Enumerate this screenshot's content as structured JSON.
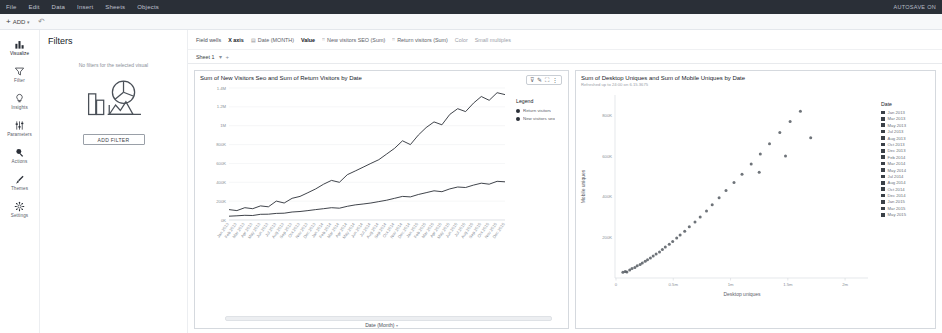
{
  "menubar": {
    "items": [
      "File",
      "Edit",
      "Data",
      "Insert",
      "Sheets",
      "Objects"
    ],
    "autosave": "AUTOSAVE ON"
  },
  "actionbar": {
    "add_label": "ADD",
    "add_icon": "plus-icon",
    "chevron_icon": "chevron-down-icon",
    "undo_icon": "undo-icon"
  },
  "rail": {
    "items": [
      {
        "label": "Visualize",
        "icon": "bar-chart-icon"
      },
      {
        "label": "Filter",
        "icon": "funnel-icon"
      },
      {
        "label": "Insights",
        "icon": "lightbulb-icon"
      },
      {
        "label": "Parameters",
        "icon": "sliders-icon"
      },
      {
        "label": "Actions",
        "icon": "cursor-click-icon"
      },
      {
        "label": "Themes",
        "icon": "paintbrush-icon"
      },
      {
        "label": "Settings",
        "icon": "gear-icon"
      }
    ]
  },
  "filters": {
    "title": "Filters",
    "empty_message": "No filters for the selected visual",
    "add_button": "ADD FILTER",
    "illustration_icon": "charts-illustration-icon"
  },
  "fieldwells": {
    "title": "Field wells",
    "xaxis_label": "X axis",
    "xaxis_field": "Date (MONTH)",
    "xaxis_icon": "calendar-icon",
    "value_label": "Value",
    "value_fields": [
      {
        "name": "New visitors SEO (Sum)",
        "icon": "measure-icon"
      },
      {
        "name": "Return visitors (Sum)",
        "icon": "measure-icon"
      }
    ],
    "color_label": "Color",
    "small_multiples_label": "Small multiples"
  },
  "sheetbar": {
    "name": "Sheet 1",
    "chevron_icon": "chevron-down-icon",
    "add_icon": "plus-icon"
  },
  "visual_toolbar": {
    "icons": [
      "filter-visual-icon",
      "edit-pencil-icon",
      "maximize-icon",
      "menu-dots-icon"
    ]
  },
  "left_visual": {
    "title": "Sum of New Visitors Seo and Sum of Return Visitors by Date",
    "legend_title": "Legend",
    "xaxis_title": "Date (Month)",
    "xaxis_chevron": "chevron-down-icon"
  },
  "right_visual": {
    "title": "Sum of Desktop Uniques and Sum of Mobile Uniques by Date",
    "subtitle": "Refreshed up to 24:00 on 6.15.3675",
    "legend_title": "Date"
  },
  "chart_data": [
    {
      "type": "line",
      "title": "Sum of New Visitors Seo and Sum of Return Visitors by Date",
      "xlabel": "Date (Month)",
      "ylabel": "",
      "ylim": [
        0,
        1400000
      ],
      "yticks": [
        "0K",
        "200K",
        "400K",
        "600K",
        "800K",
        "1M",
        "1.2M",
        "1.4M"
      ],
      "ytick_values": [
        0,
        200000,
        400000,
        600000,
        800000,
        1000000,
        1200000,
        1400000
      ],
      "grid": true,
      "legend_position": "right",
      "categories": [
        "Jan 2013",
        "Feb 2013",
        "Mar 2013",
        "Apr 2013",
        "May 2013",
        "Jun 2013",
        "Jul 2013",
        "Aug 2013",
        "Sep 2013",
        "Oct 2013",
        "Nov 2013",
        "Dec 2013",
        "Jan 2014",
        "Feb 2014",
        "Mar 2014",
        "Apr 2014",
        "May 2014",
        "Jun 2014",
        "Jul 2014",
        "Aug 2014",
        "Sep 2014",
        "Oct 2014",
        "Nov 2014",
        "Dec 2014",
        "Jan 2015",
        "Feb 2015",
        "Mar 2015",
        "Apr 2015",
        "May 2015",
        "Jun 2015",
        "Jul 2015",
        "Aug 2015",
        "Sep 2015",
        "Oct 2015",
        "Nov 2015",
        "Dec 2015"
      ],
      "series": [
        {
          "name": "Return visitors",
          "color": "#2a2f37",
          "values": [
            110000,
            100000,
            130000,
            120000,
            150000,
            140000,
            200000,
            180000,
            230000,
            250000,
            290000,
            330000,
            380000,
            420000,
            400000,
            480000,
            520000,
            560000,
            600000,
            640000,
            700000,
            760000,
            840000,
            800000,
            900000,
            980000,
            1040000,
            1010000,
            1120000,
            1180000,
            1150000,
            1240000,
            1310000,
            1270000,
            1350000,
            1330000
          ]
        },
        {
          "name": "New visitors seo",
          "color": "#2a2f37",
          "values": [
            40000,
            45000,
            50000,
            48000,
            60000,
            62000,
            70000,
            72000,
            85000,
            90000,
            100000,
            110000,
            120000,
            130000,
            125000,
            145000,
            160000,
            170000,
            180000,
            195000,
            210000,
            230000,
            250000,
            245000,
            270000,
            290000,
            310000,
            300000,
            330000,
            350000,
            345000,
            370000,
            390000,
            380000,
            410000,
            405000
          ]
        }
      ]
    },
    {
      "type": "scatter",
      "title": "Sum of Desktop Uniques and Sum of Mobile Uniques by Date",
      "subtitle": "Refreshed up to 24:00 on 6.15.3675",
      "xlabel": "Desktop uniques",
      "ylabel": "Mobile uniques",
      "xticks": [
        "0",
        "0.5m",
        "1m",
        "1.5m",
        "2m"
      ],
      "xtick_values": [
        0,
        500000,
        1000000,
        1500000,
        2000000
      ],
      "yticks": [
        "200K",
        "400K",
        "600K",
        "800K"
      ],
      "ytick_values": [
        200000,
        400000,
        600000,
        800000
      ],
      "xlim": [
        0,
        2200000
      ],
      "ylim": [
        0,
        900000
      ],
      "grid": false,
      "legend_position": "right",
      "legend_title": "Date",
      "legend_entries": [
        "Jan 2013",
        "Mar 2013",
        "May 2013",
        "Jul 2013",
        "Aug 2013",
        "Oct 2013",
        "Dec 2013",
        "Feb 2014",
        "Mar 2014",
        "May 2014",
        "Jul 2014",
        "Aug 2014",
        "Oct 2014",
        "Dec 2014",
        "Jan 2015",
        "Mar 2015",
        "May 2015"
      ],
      "points": [
        {
          "x": 60000,
          "y": 28000
        },
        {
          "x": 80000,
          "y": 32000
        },
        {
          "x": 95000,
          "y": 30000
        },
        {
          "x": 120000,
          "y": 40000
        },
        {
          "x": 140000,
          "y": 46000
        },
        {
          "x": 165000,
          "y": 52000
        },
        {
          "x": 185000,
          "y": 60000
        },
        {
          "x": 210000,
          "y": 66000
        },
        {
          "x": 230000,
          "y": 74000
        },
        {
          "x": 255000,
          "y": 82000
        },
        {
          "x": 275000,
          "y": 90000
        },
        {
          "x": 300000,
          "y": 98000
        },
        {
          "x": 325000,
          "y": 108000
        },
        {
          "x": 350000,
          "y": 118000
        },
        {
          "x": 380000,
          "y": 128000
        },
        {
          "x": 405000,
          "y": 140000
        },
        {
          "x": 430000,
          "y": 152000
        },
        {
          "x": 465000,
          "y": 166000
        },
        {
          "x": 495000,
          "y": 180000
        },
        {
          "x": 530000,
          "y": 196000
        },
        {
          "x": 560000,
          "y": 212000
        },
        {
          "x": 600000,
          "y": 230000
        },
        {
          "x": 640000,
          "y": 252000
        },
        {
          "x": 690000,
          "y": 276000
        },
        {
          "x": 735000,
          "y": 300000
        },
        {
          "x": 790000,
          "y": 330000
        },
        {
          "x": 840000,
          "y": 360000
        },
        {
          "x": 900000,
          "y": 395000
        },
        {
          "x": 960000,
          "y": 430000
        },
        {
          "x": 1030000,
          "y": 470000
        },
        {
          "x": 1100000,
          "y": 510000
        },
        {
          "x": 1180000,
          "y": 560000
        },
        {
          "x": 1260000,
          "y": 610000
        },
        {
          "x": 1340000,
          "y": 660000
        },
        {
          "x": 1430000,
          "y": 715000
        },
        {
          "x": 1520000,
          "y": 770000
        },
        {
          "x": 1610000,
          "y": 820000
        },
        {
          "x": 1700000,
          "y": 690000
        },
        {
          "x": 1480000,
          "y": 600000
        },
        {
          "x": 1250000,
          "y": 520000
        }
      ]
    }
  ]
}
